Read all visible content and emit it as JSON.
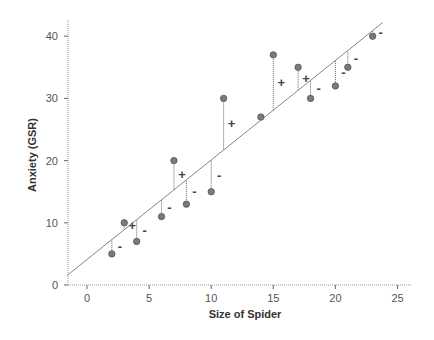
{
  "chart_data": {
    "type": "scatter",
    "title": "",
    "xlabel": "Size of Spider",
    "ylabel": "Anxiety (GSR)",
    "xlim": [
      -1.6,
      26
    ],
    "ylim": [
      0,
      42
    ],
    "xticks": [
      0,
      5,
      10,
      15,
      20,
      25
    ],
    "yticks": [
      0,
      10,
      20,
      30,
      40
    ],
    "grid": false,
    "legend": null,
    "points": [
      {
        "x": 2,
        "y": 5,
        "residual_sign": "-"
      },
      {
        "x": 3,
        "y": 10,
        "residual_sign": "+"
      },
      {
        "x": 4,
        "y": 7,
        "residual_sign": "-"
      },
      {
        "x": 6,
        "y": 11,
        "residual_sign": "-"
      },
      {
        "x": 7,
        "y": 20,
        "residual_sign": "+"
      },
      {
        "x": 8,
        "y": 13,
        "residual_sign": "-"
      },
      {
        "x": 10,
        "y": 15,
        "residual_sign": "-"
      },
      {
        "x": 11,
        "y": 30,
        "residual_sign": "+"
      },
      {
        "x": 14,
        "y": 27,
        "residual_sign": ""
      },
      {
        "x": 15,
        "y": 37,
        "residual_sign": "+"
      },
      {
        "x": 17,
        "y": 35,
        "residual_sign": "+"
      },
      {
        "x": 18,
        "y": 30,
        "residual_sign": "-"
      },
      {
        "x": 20,
        "y": 32,
        "residual_sign": "-"
      },
      {
        "x": 21,
        "y": 35,
        "residual_sign": "-"
      },
      {
        "x": 23,
        "y": 40,
        "residual_sign": "-"
      }
    ],
    "regression_line": {
      "slope": 1.6,
      "intercept": 4.1,
      "x_start": -1.6,
      "x_end": 23.8
    },
    "annotations": "Dotted vertical residual lines connect each point to the regression line, labelled + (above line) or - (below line)",
    "colors": {
      "point_fill": "#7a7a7a",
      "point_stroke": "#555555",
      "line": "#888888",
      "residual": "#666666",
      "axis": "#999999"
    }
  }
}
